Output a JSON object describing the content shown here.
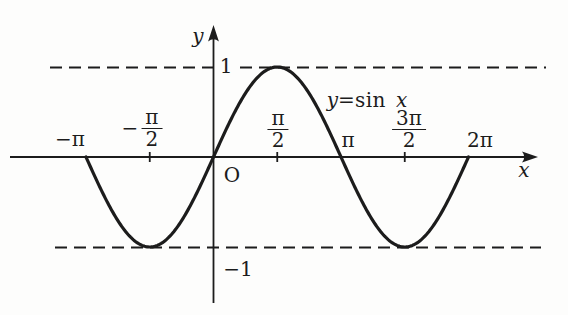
{
  "figure": {
    "background": "#fdfdfc",
    "ink_color": "#1c1c1c"
  },
  "labels": {
    "y_axis": "y",
    "x_axis": "x",
    "origin": "O",
    "y_tick_pos": "1",
    "y_tick_neg": "−1",
    "x_tick_neg_pi": "−π",
    "x_tick_neg_half_pi": {
      "sign": "−",
      "num": "π",
      "den": "2"
    },
    "x_tick_half_pi": {
      "num": "π",
      "den": "2"
    },
    "x_tick_pi": "π",
    "x_tick_three_half_pi": {
      "num": "3π",
      "den": "2"
    },
    "x_tick_two_pi": "2π",
    "curve_label": {
      "lhs": "y",
      "eq": "=",
      "fn": "sin",
      "arg": "x"
    }
  },
  "chart_data": {
    "type": "line",
    "title": "",
    "function": "y = sin x",
    "xlabel": "x",
    "ylabel": "y",
    "x_domain": [
      -3.14159265,
      6.28318531
    ],
    "y_range": [
      -1,
      1
    ],
    "x_tick_labels": [
      "−π",
      "−π/2",
      "O",
      "π/2",
      "π",
      "3π/2",
      "2π"
    ],
    "x_tick_values": [
      -3.1416,
      -1.5708,
      0,
      1.5708,
      3.1416,
      4.7124,
      6.2832
    ],
    "y_tick_values": [
      1,
      -1
    ],
    "guide_lines": [
      {
        "y": 1,
        "style": "dashed"
      },
      {
        "y": -1,
        "style": "dashed"
      }
    ],
    "key_points": [
      {
        "x": -3.1416,
        "y": 0
      },
      {
        "x": -1.5708,
        "y": -1
      },
      {
        "x": 0,
        "y": 0
      },
      {
        "x": 1.5708,
        "y": 1
      },
      {
        "x": 3.1416,
        "y": 0
      },
      {
        "x": 4.7124,
        "y": -1
      },
      {
        "x": 6.2832,
        "y": 0
      }
    ],
    "legend": "none",
    "grid": false
  }
}
